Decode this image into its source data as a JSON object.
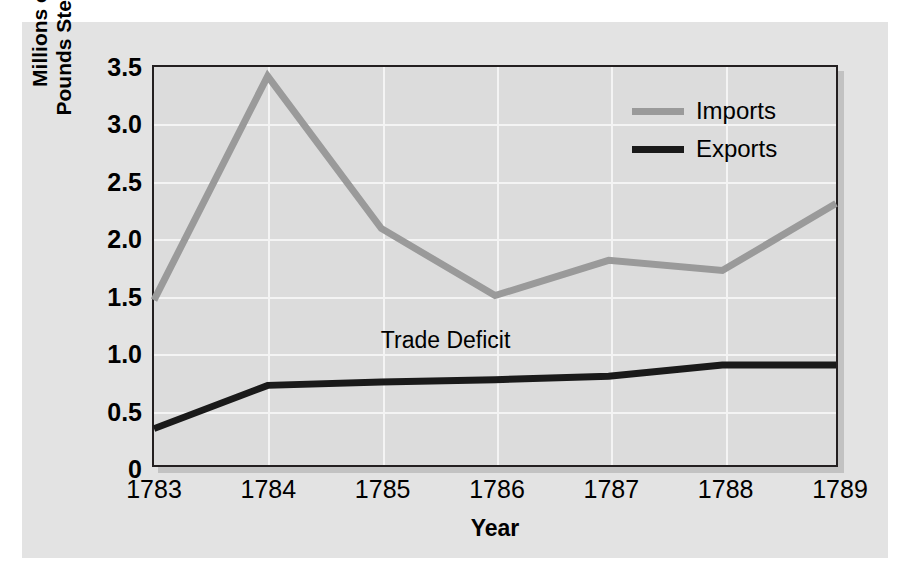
{
  "chart_data": {
    "type": "line",
    "title": "",
    "subtitle": "",
    "xlabel": "Year",
    "ylabel": "Millions of Pounds Sterling",
    "ylabel_lines": [
      "Millions of",
      "Pounds Sterling"
    ],
    "categories": [
      "1783",
      "1784",
      "1785",
      "1786",
      "1787",
      "1788",
      "1789"
    ],
    "x": [
      1783,
      1784,
      1785,
      1786,
      1787,
      1788,
      1789
    ],
    "series": [
      {
        "name": "Imports",
        "color": "#9a9a9a",
        "values": [
          1.45,
          3.42,
          2.08,
          1.49,
          1.8,
          1.71,
          2.3
        ]
      },
      {
        "name": "Exports",
        "color": "#1a1a1a",
        "values": [
          0.32,
          0.7,
          0.73,
          0.75,
          0.78,
          0.88,
          0.88
        ]
      }
    ],
    "ylim": [
      0,
      3.5
    ],
    "yticks": [
      0,
      0.5,
      1.0,
      1.5,
      2.0,
      2.5,
      3.0,
      3.5
    ],
    "ytick_labels": [
      "0",
      "0.5",
      "1.0",
      "1.5",
      "2.0",
      "2.5",
      "3.0",
      "3.5"
    ],
    "xtick_labels": [
      "1783",
      "1784",
      "1785",
      "1786",
      "1787",
      "1788",
      "1789"
    ],
    "grid": true,
    "grid_color": "#f4f4f4",
    "legend_position": "top-right",
    "annotations": [
      {
        "text": "Trade Deficit",
        "x": 1785.55,
        "y": 1.12
      }
    ],
    "plot_background": "#dcdcdc",
    "panel_background": "#e3e3e3",
    "frame_color": "#231f20"
  },
  "legend": {
    "items": [
      {
        "label": "Imports",
        "color": "#9a9a9a"
      },
      {
        "label": "Exports",
        "color": "#1a1a1a"
      }
    ]
  }
}
